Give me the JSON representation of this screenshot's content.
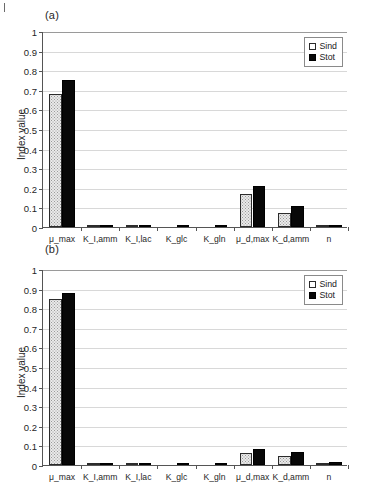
{
  "figure": {
    "panel_a_label": "(a)",
    "panel_b_label": "(b)"
  },
  "legend": {
    "position": "top-right",
    "items": [
      {
        "label": "Sind",
        "swatch": "white-square-icon"
      },
      {
        "label": "Stot",
        "swatch": "black-square-icon"
      }
    ]
  },
  "axis": {
    "ylabel": "Index value",
    "yticks": [
      "0",
      "0.1",
      "0.2",
      "0.3",
      "0.4",
      "0.5",
      "0.6",
      "0.7",
      "0.8",
      "0.9",
      "1"
    ]
  },
  "chart_data": [
    {
      "type": "bar",
      "title": "(a)",
      "xlabel": "",
      "ylabel": "Index value",
      "ylim": [
        0,
        1
      ],
      "ytick_step": 0.1,
      "grid": true,
      "legend": "top-right",
      "categories": [
        "μ_max",
        "K_I,amm",
        "K_I,lac",
        "K_glc",
        "K_gln",
        "μ_d,max",
        "K_d,amm",
        "n"
      ],
      "series": [
        {
          "name": "Sind",
          "values": [
            0.68,
            0.002,
            0.001,
            0.0,
            0.0,
            0.166,
            0.071,
            0.005
          ]
        },
        {
          "name": "Stot",
          "values": [
            0.75,
            0.01,
            0.007,
            0.001,
            0.001,
            0.211,
            0.105,
            0.006
          ]
        }
      ]
    },
    {
      "type": "bar",
      "title": "(b)",
      "xlabel": "",
      "ylabel": "Index value",
      "ylim": [
        0,
        1
      ],
      "ytick_step": 0.1,
      "grid": true,
      "legend": "top-right",
      "categories": [
        "μ_max",
        "K_I,amm",
        "K_I,lac",
        "K_glc",
        "K_gln",
        "μ_d,max",
        "K_d,amm",
        "n"
      ],
      "series": [
        {
          "name": "Sind",
          "values": [
            0.845,
            0.006,
            0.003,
            0.0,
            0.0,
            0.06,
            0.047,
            0.007
          ]
        },
        {
          "name": "Stot",
          "values": [
            0.876,
            0.007,
            0.006,
            0.005,
            0.001,
            0.082,
            0.065,
            0.013
          ]
        }
      ]
    }
  ]
}
